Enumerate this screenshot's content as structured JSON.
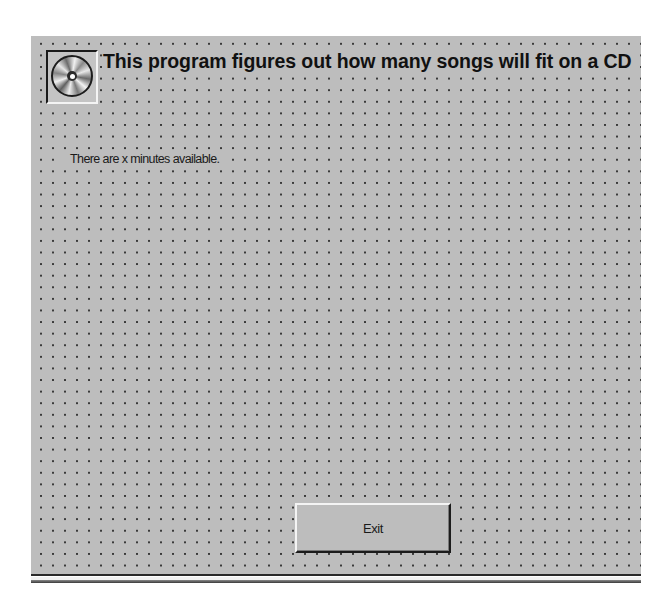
{
  "form": {
    "title": "This program figures out how many songs will fit on a CD",
    "icon": "cd-disc-icon",
    "info_label": "There are x minutes available.",
    "exit_button_label": "Exit"
  },
  "colors": {
    "form_background": "#bdbdbd",
    "grid_dot": "#3a3a3a",
    "text": "#111111"
  }
}
